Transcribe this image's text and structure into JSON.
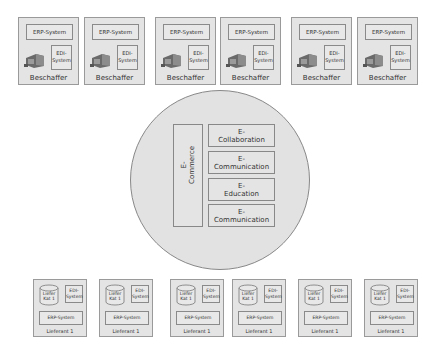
{
  "buyers": [
    {
      "erp": "ERP-System",
      "edi_line1": "EDI-",
      "edi_line2": "System",
      "label": "Beschaffer",
      "x": 18
    },
    {
      "erp": "ERP-System",
      "edi_line1": "EDI-",
      "edi_line2": "System",
      "label": "Beschaffer",
      "x": 84
    },
    {
      "erp": "ERP-System",
      "edi_line1": "EDI-",
      "edi_line2": "System",
      "label": "Beschaffer",
      "x": 155
    },
    {
      "erp": "ERP-System",
      "edi_line1": "EDI-",
      "edi_line2": "System",
      "label": "Beschaffer",
      "x": 220
    },
    {
      "erp": "ERP-System",
      "edi_line1": "EDI-",
      "edi_line2": "System",
      "label": "Beschaffer",
      "x": 291
    },
    {
      "erp": "ERP-System",
      "edi_line1": "EDI-",
      "edi_line2": "System",
      "label": "Beschaffer",
      "x": 357
    }
  ],
  "center": {
    "ecommerce_line1": "E-",
    "ecommerce_line2": "Commerce",
    "modules": [
      {
        "line1": "E-",
        "line2": "Collaboration"
      },
      {
        "line1": "E-",
        "line2": "Communication"
      },
      {
        "line1": "E-",
        "line2": "Education"
      },
      {
        "line1": "E-",
        "line2": "Communication"
      }
    ]
  },
  "suppliers": [
    {
      "cat_line1": "Liefer",
      "cat_line2": "Kat 1",
      "edi_line1": "EDI-",
      "edi_line2": "System",
      "erp": "ERP-System",
      "label": "Lieferant 1",
      "x": 33
    },
    {
      "cat_line1": "Liefer",
      "cat_line2": "Kat 1",
      "edi_line1": "EDI-",
      "edi_line2": "System",
      "erp": "ERP-System",
      "label": "Lieferant 1",
      "x": 99
    },
    {
      "cat_line1": "Liefer",
      "cat_line2": "Kat 1",
      "edi_line1": "EDI-",
      "edi_line2": "System",
      "erp": "ERP-System",
      "label": "Lieferant 1",
      "x": 170
    },
    {
      "cat_line1": "Liefer",
      "cat_line2": "Kat 1",
      "edi_line1": "EDI-",
      "edi_line2": "System",
      "erp": "ERP-System",
      "label": "Lieferant 1",
      "x": 232
    },
    {
      "cat_line1": "Liefer",
      "cat_line2": "Kat 1",
      "edi_line1": "EDI-",
      "edi_line2": "System",
      "erp": "ERP-System",
      "label": "Lieferant 1",
      "x": 298
    },
    {
      "cat_line1": "Liefer",
      "cat_line2": "Kat 1",
      "edi_line1": "EDI-",
      "edi_line2": "System",
      "erp": "ERP-System",
      "label": "Lieferant 1",
      "x": 364
    }
  ]
}
